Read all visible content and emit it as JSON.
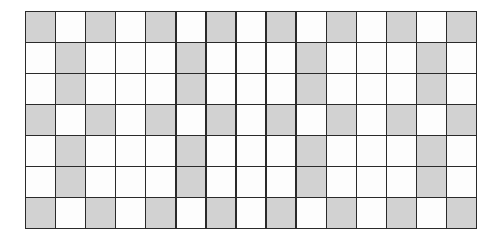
{
  "grid": {
    "rows": 7,
    "columns": 15,
    "colors": {
      "shaded": "#d2d2d2",
      "unshaded": "#fdfdfd",
      "lines": "#2a2a2a"
    },
    "pattern": [
      [
        1,
        0,
        1,
        0,
        1,
        0,
        1,
        0,
        1,
        0,
        1,
        0,
        1,
        0,
        1
      ],
      [
        0,
        1,
        0,
        0,
        0,
        1,
        0,
        0,
        0,
        1,
        0,
        0,
        0,
        1,
        0
      ],
      [
        0,
        1,
        0,
        0,
        0,
        1,
        0,
        0,
        0,
        1,
        0,
        0,
        0,
        1,
        0
      ],
      [
        1,
        0,
        1,
        0,
        1,
        0,
        1,
        0,
        1,
        0,
        1,
        0,
        1,
        0,
        1
      ],
      [
        0,
        1,
        0,
        0,
        0,
        1,
        0,
        0,
        0,
        1,
        0,
        0,
        0,
        1,
        0
      ],
      [
        0,
        1,
        0,
        0,
        0,
        1,
        0,
        0,
        0,
        1,
        0,
        0,
        0,
        1,
        0
      ],
      [
        1,
        0,
        1,
        0,
        1,
        0,
        1,
        0,
        1,
        0,
        1,
        0,
        1,
        0,
        1
      ]
    ]
  }
}
